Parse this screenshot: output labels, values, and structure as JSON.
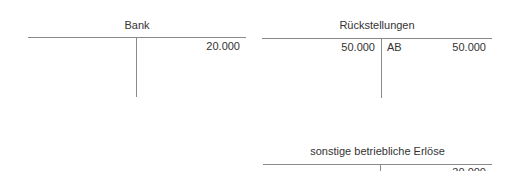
{
  "accounts": [
    {
      "name": "Bank",
      "debit": [],
      "credit": [
        {
          "label": "",
          "amount": "20.000"
        }
      ]
    },
    {
      "name": "Rückstellungen",
      "debit": [
        {
          "label": "",
          "amount": "50.000"
        }
      ],
      "credit": [
        {
          "label": "AB",
          "amount": "50.000"
        }
      ]
    },
    {
      "name": "sonstige betriebliche Erlöse",
      "debit": [],
      "credit": [
        {
          "label": "",
          "amount": "30.000"
        }
      ]
    }
  ]
}
